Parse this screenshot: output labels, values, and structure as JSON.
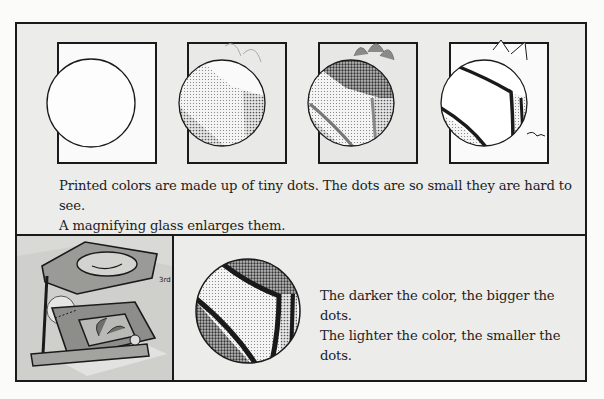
{
  "document": {
    "top_panel": {
      "frames": [
        {
          "label": "stage-1",
          "description": "empty magnifier circle over plain frame"
        },
        {
          "label": "stage-2",
          "description": "light dotted pattern with pale leaves"
        },
        {
          "label": "stage-3",
          "description": "denser dot pattern with dark leaves"
        },
        {
          "label": "stage-4",
          "description": "outline drawing with thick dark lines"
        }
      ],
      "caption_line1": "Printed colors are made up of tiny dots. The dots are so small they are hard to see.",
      "caption_line2": "A magnifying glass enlarges them."
    },
    "bottom_panel": {
      "photo_description": "folding magnifier (linen tester) over a printed picture",
      "photo_mark": "3rd",
      "caption_line1": "The darker the color, the bigger the dots.",
      "caption_line2": "The lighter the color, the smaller the dots."
    },
    "colors": {
      "panel_bg": "#ececea",
      "border": "#1a1a1a",
      "page_bg": "#fbfbfa"
    }
  }
}
